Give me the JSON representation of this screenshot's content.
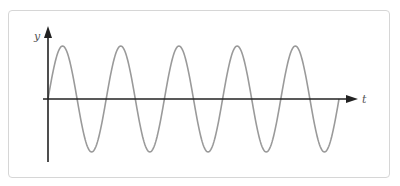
{
  "diagram": {
    "axes": {
      "x_label": "t",
      "y_label": "y"
    },
    "colors": {
      "axis": "#222222",
      "wave": "#9a9a9a",
      "border": "#d6d6d6"
    }
  },
  "chart_data": {
    "type": "line",
    "title": "",
    "xlabel": "t",
    "ylabel": "y",
    "series": [
      {
        "name": "sine wave",
        "function": "y = sin(t)",
        "cycles": 5,
        "amplitude": 1
      }
    ],
    "grid": false
  }
}
